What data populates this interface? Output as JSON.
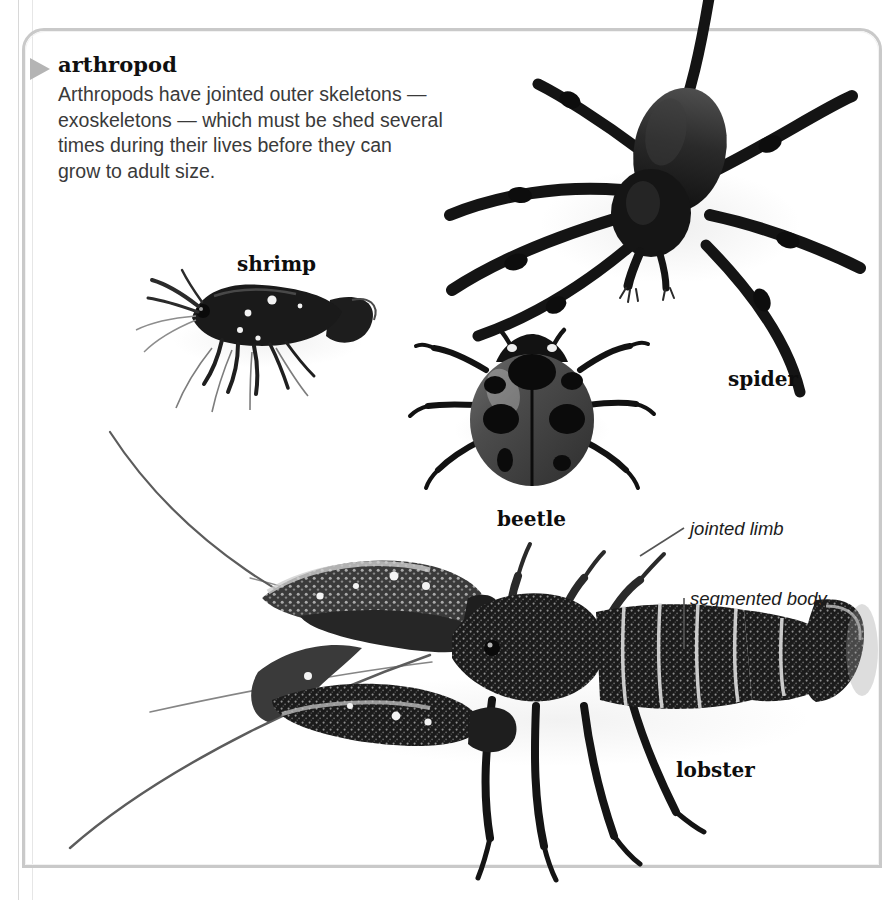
{
  "entry": {
    "title": "arthropod",
    "body_lines": [
      "Arthropods have jointed outer skeletons —",
      "exoskeletons — which must be shed several",
      "times during their lives before they can",
      "grow to adult size."
    ],
    "bullet_icon": "triangle-right-icon"
  },
  "specimens": [
    {
      "id": "shrimp",
      "label": "shrimp"
    },
    {
      "id": "spider",
      "label": "spider"
    },
    {
      "id": "beetle",
      "label": "beetle"
    },
    {
      "id": "lobster",
      "label": "lobster"
    }
  ],
  "annotations": [
    {
      "id": "jointed-limb",
      "label": "jointed limb"
    },
    {
      "id": "segmented-body",
      "label": "segmented body"
    }
  ],
  "colors": {
    "page_background": "#ffffff",
    "frame_border": "#c9c9c9",
    "rule_line": "#d8d8d8",
    "bullet": "#b4b4b4",
    "title_text": "#101010",
    "body_text": "#3a3a3a",
    "label_text": "#0d0d0d",
    "annotation_text": "#1c1c1c",
    "leader_line": "#555555",
    "specimen_dark": "#141414",
    "specimen_mid": "#4a4a4a",
    "specimen_light": "#9b9b9b"
  }
}
